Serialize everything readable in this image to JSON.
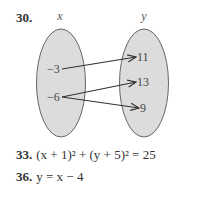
{
  "problem30": {
    "number": "30.",
    "domain_label": "x",
    "range_label": "y",
    "domain_values": [
      "−3",
      "−6"
    ],
    "range_values": [
      "11",
      "13",
      "9"
    ],
    "mappings": [
      [
        "−3",
        "11"
      ],
      [
        "−6",
        "13"
      ],
      [
        "−6",
        "9"
      ]
    ],
    "fill_color": "#dcdcdc",
    "stroke_color": "#555555"
  },
  "problem33": {
    "number": "33.",
    "equation": "(x + 1)² + (y + 5)² = 25"
  },
  "problem36": {
    "number": "36.",
    "equation": "y = x − 4"
  }
}
